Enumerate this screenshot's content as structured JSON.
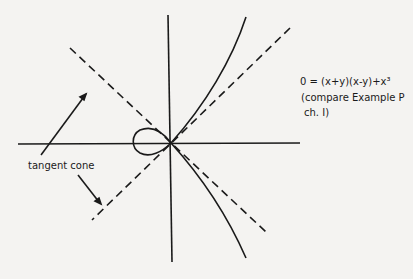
{
  "figure": {
    "equation": "0 = (x+y)(x-y)+x³",
    "note_line1": "(compare Example P",
    "note_line2": "ch. I)",
    "callout": "tangent cone"
  },
  "colors": {
    "ink": "#1a1a1a",
    "paper": "#f4f3f1"
  }
}
